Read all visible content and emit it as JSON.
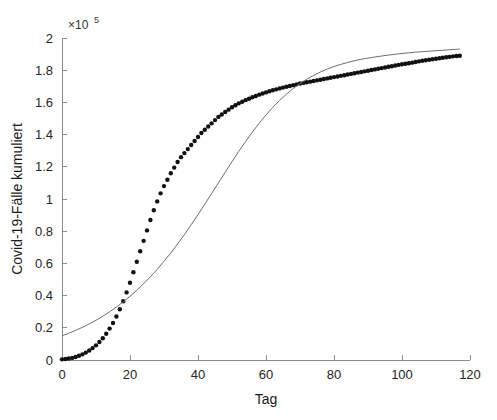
{
  "figure": {
    "background": "#ffffff",
    "axis_color": "#8c8c8c",
    "text_color": "#262626"
  },
  "axes": {
    "y_exponent_prefix": "×10",
    "y_exponent_power": "5",
    "x_title": "Tag",
    "y_title": "Covid-19-Fälle kumuliert",
    "x_ticks": [
      "0",
      "20",
      "40",
      "60",
      "80",
      "100",
      "120"
    ],
    "y_ticks": [
      "0",
      "0.2",
      "0.4",
      "0.6",
      "0.8",
      "1",
      "1.2",
      "1.4",
      "1.6",
      "1.8",
      "2"
    ]
  },
  "chart_data": {
    "type": "line",
    "title": "",
    "xlabel": "Tag",
    "ylabel": "Covid-19-Fälle kumuliert",
    "xlim": [
      0,
      120
    ],
    "ylim": [
      0,
      200000
    ],
    "y_axis_exponent": 100000,
    "grid": false,
    "legend": null,
    "series": [
      {
        "name": "Covid-19-Fälle kumuliert (Daten)",
        "style": "markers",
        "marker": "dot",
        "marker_size": 3.2,
        "color": "#111111",
        "x": [
          0,
          1,
          2,
          3,
          4,
          5,
          6,
          7,
          8,
          9,
          10,
          11,
          12,
          13,
          14,
          15,
          16,
          17,
          18,
          19,
          20,
          21,
          22,
          23,
          24,
          25,
          26,
          27,
          28,
          29,
          30,
          31,
          32,
          33,
          34,
          35,
          36,
          37,
          38,
          39,
          40,
          41,
          42,
          43,
          44,
          45,
          46,
          47,
          48,
          49,
          50,
          51,
          52,
          53,
          54,
          55,
          56,
          57,
          58,
          59,
          60,
          61,
          62,
          63,
          64,
          65,
          66,
          67,
          68,
          69,
          70,
          71,
          72,
          73,
          74,
          75,
          76,
          77,
          78,
          79,
          80,
          81,
          82,
          83,
          84,
          85,
          86,
          87,
          88,
          89,
          90,
          91,
          92,
          93,
          94,
          95,
          96,
          97,
          98,
          99,
          100,
          101,
          102,
          103,
          104,
          105,
          106,
          107,
          108,
          109,
          110,
          111,
          112,
          113,
          114,
          115,
          116,
          117
        ],
        "y": [
          400,
          600,
          900,
          1300,
          1900,
          2600,
          3500,
          4600,
          5900,
          7400,
          9100,
          11200,
          13500,
          16300,
          19500,
          23000,
          27000,
          31500,
          36500,
          42000,
          48000,
          54500,
          61000,
          67500,
          74000,
          80500,
          87000,
          93000,
          98500,
          103500,
          108000,
          112000,
          116000,
          119500,
          123000,
          126000,
          128500,
          131000,
          133500,
          136000,
          138500,
          141000,
          143000,
          145000,
          147000,
          149000,
          151000,
          152500,
          154000,
          155500,
          157000,
          158200,
          159400,
          160400,
          161400,
          162300,
          163200,
          164000,
          164800,
          165500,
          166200,
          166900,
          167500,
          168100,
          168700,
          169200,
          169700,
          170200,
          170700,
          171200,
          171700,
          172100,
          172500,
          172900,
          173300,
          173700,
          174100,
          174500,
          174900,
          175300,
          175700,
          176100,
          176500,
          176900,
          177300,
          177700,
          178100,
          178500,
          178900,
          179300,
          179700,
          180100,
          180500,
          180900,
          181300,
          181700,
          182100,
          182500,
          182900,
          183300,
          183700,
          184000,
          184300,
          184700,
          185100,
          185500,
          185900,
          186200,
          186500,
          186800,
          187100,
          187400,
          187700,
          188000,
          188300,
          188600,
          188800,
          189000
        ]
      },
      {
        "name": "Modellkurve (Fit)",
        "style": "line",
        "line_width": 1,
        "color": "#6e6e6e",
        "x": [
          0,
          2,
          4,
          6,
          8,
          10,
          12,
          14,
          16,
          18,
          20,
          22,
          24,
          26,
          28,
          30,
          32,
          34,
          36,
          38,
          40,
          42,
          44,
          46,
          48,
          50,
          52,
          54,
          56,
          58,
          60,
          62,
          64,
          66,
          68,
          70,
          72,
          74,
          76,
          78,
          80,
          82,
          84,
          86,
          88,
          90,
          92,
          94,
          96,
          98,
          100,
          102,
          104,
          106,
          108,
          110,
          112,
          114,
          116,
          117
        ],
        "y": [
          15000,
          16600,
          18400,
          20300,
          22400,
          24700,
          27200,
          29900,
          32900,
          36100,
          39600,
          43300,
          47400,
          51700,
          56300,
          61300,
          66500,
          72100,
          77900,
          84000,
          90300,
          96800,
          103400,
          110000,
          116600,
          123200,
          129600,
          135700,
          141600,
          147100,
          152200,
          156900,
          161200,
          165100,
          168600,
          171700,
          174400,
          176800,
          178900,
          180700,
          182300,
          183600,
          184800,
          185900,
          186800,
          187500,
          188200,
          188800,
          189400,
          189900,
          190400,
          190800,
          191200,
          191500,
          191800,
          192100,
          192400,
          192700,
          193000,
          193100
        ]
      }
    ]
  }
}
